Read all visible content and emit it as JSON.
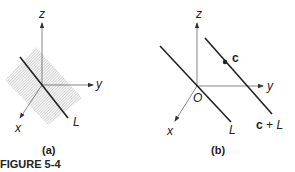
{
  "figure": {
    "caption": "FIGURE 5-4",
    "panels": [
      {
        "label": "(a)",
        "axes": {
          "x": "x",
          "y": "y",
          "z": "z"
        },
        "line_label": "L",
        "plane": "hatched plane containing L through origin"
      },
      {
        "label": "(b)",
        "axes": {
          "x": "x",
          "y": "y",
          "z": "z"
        },
        "origin_label": "O",
        "line_label": "L",
        "point_label": "c",
        "translated_line_label": "c + L"
      }
    ]
  },
  "colors": {
    "ink": "#222222",
    "hatch": "#9a9a9a"
  }
}
